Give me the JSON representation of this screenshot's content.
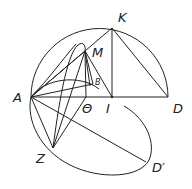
{
  "figure": {
    "labels": {
      "A": "A",
      "K": "K",
      "M": "M",
      "B": "B",
      "theta": "Θ",
      "I": "I",
      "D": "D",
      "Z": "Z",
      "D_prime": "D′"
    }
  }
}
